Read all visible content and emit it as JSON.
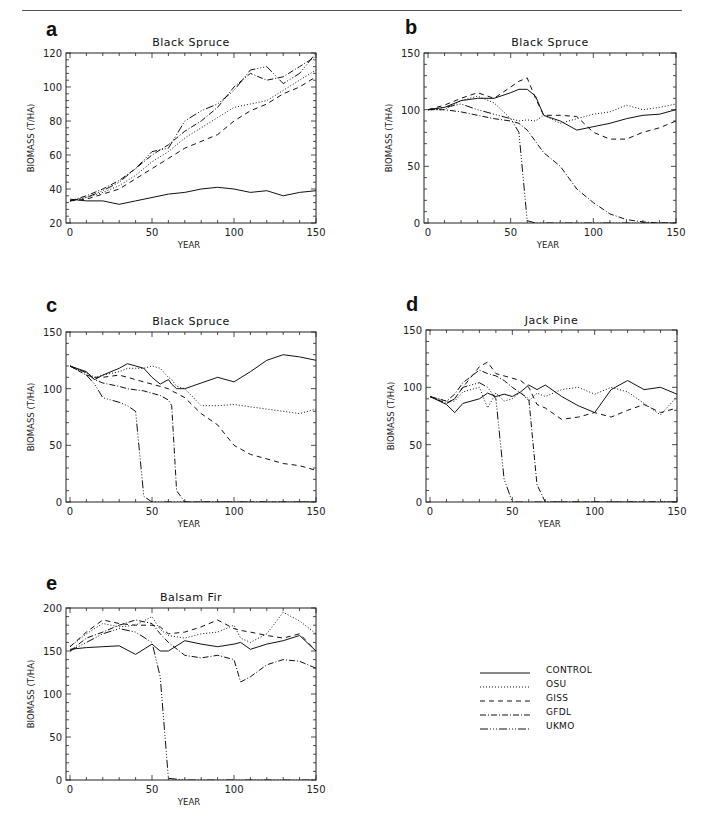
{
  "page": {
    "number": ""
  },
  "legend": {
    "items": [
      {
        "label": "CONTROL",
        "dash": ""
      },
      {
        "label": "OSU",
        "dash": "1,2"
      },
      {
        "label": "GISS",
        "dash": "5,4"
      },
      {
        "label": "GFDL",
        "dash": "6,2,1,2"
      },
      {
        "label": "UKMO",
        "dash": "8,2,1,2,1,2,1,2"
      }
    ]
  },
  "chart_data": [
    {
      "panel": "a",
      "type": "line",
      "title": "Black Spruce",
      "xlabel": "YEAR",
      "ylabel": "BIOMASS (T/HA)",
      "xlim": [
        0,
        150
      ],
      "ylim": [
        20,
        120
      ],
      "xticks": [
        0,
        50,
        100,
        150
      ],
      "yticks": [
        20,
        40,
        60,
        80,
        100,
        120
      ],
      "box": {
        "left": 70,
        "top": 53,
        "width": 246,
        "height": 170
      },
      "x": [
        0,
        10,
        20,
        30,
        40,
        50,
        60,
        70,
        80,
        90,
        100,
        110,
        120,
        130,
        140,
        150
      ],
      "series": [
        {
          "name": "CONTROL",
          "values": [
            34,
            33,
            33,
            31,
            33,
            35,
            37,
            38,
            40,
            41,
            40,
            38,
            39,
            36,
            38,
            39
          ]
        },
        {
          "name": "OSU",
          "values": [
            33,
            35,
            38,
            42,
            48,
            56,
            62,
            70,
            76,
            82,
            88,
            90,
            92,
            98,
            104,
            110
          ]
        },
        {
          "name": "GISS",
          "values": [
            33,
            34,
            37,
            40,
            46,
            52,
            58,
            64,
            68,
            72,
            80,
            86,
            90,
            96,
            100,
            106
          ]
        },
        {
          "name": "GFDL",
          "values": [
            33,
            36,
            40,
            45,
            52,
            60,
            66,
            74,
            80,
            88,
            100,
            108,
            104,
            106,
            112,
            118
          ]
        },
        {
          "name": "UKMO",
          "values": [
            33,
            35,
            39,
            44,
            52,
            62,
            64,
            80,
            86,
            90,
            98,
            110,
            112,
            102,
            108,
            120
          ]
        }
      ]
    },
    {
      "panel": "b",
      "type": "line",
      "title": "Black Spruce",
      "xlabel": "YEAR",
      "ylabel": "BIOMASS (T/HA)",
      "xlim": [
        0,
        150
      ],
      "ylim": [
        0,
        150
      ],
      "xticks": [
        0,
        50,
        100,
        150
      ],
      "yticks": [
        0,
        50,
        100,
        150
      ],
      "box": {
        "left": 428,
        "top": 53,
        "width": 248,
        "height": 170
      },
      "x": [
        0,
        10,
        20,
        30,
        40,
        50,
        55,
        60,
        65,
        70,
        80,
        90,
        100,
        110,
        120,
        130,
        140,
        150
      ],
      "series": [
        {
          "name": "CONTROL",
          "values": [
            100,
            102,
            108,
            110,
            110,
            115,
            118,
            118,
            112,
            95,
            90,
            82,
            85,
            88,
            92,
            95,
            96,
            100
          ]
        },
        {
          "name": "OSU",
          "values": [
            100,
            100,
            108,
            112,
            106,
            92,
            90,
            91,
            90,
            95,
            88,
            92,
            96,
            98,
            104,
            100,
            102,
            105
          ]
        },
        {
          "name": "GISS",
          "values": [
            100,
            104,
            110,
            115,
            110,
            120,
            125,
            128,
            110,
            95,
            95,
            94,
            80,
            74,
            74,
            80,
            84,
            90
          ]
        },
        {
          "name": "GFDL",
          "values": [
            100,
            100,
            98,
            95,
            92,
            90,
            88,
            82,
            72,
            62,
            50,
            30,
            18,
            8,
            3,
            1,
            0,
            0
          ]
        },
        {
          "name": "UKMO",
          "values": [
            100,
            102,
            105,
            100,
            96,
            92,
            80,
            2,
            0,
            0,
            0,
            0,
            0,
            0,
            0,
            0,
            0,
            0
          ]
        }
      ]
    },
    {
      "panel": "c",
      "type": "line",
      "title": "Black Spruce",
      "xlabel": "YEAR",
      "ylabel": "BIOMASS (T/HA)",
      "xlim": [
        0,
        150
      ],
      "ylim": [
        0,
        150
      ],
      "xticks": [
        0,
        50,
        100,
        150
      ],
      "yticks": [
        0,
        50,
        100,
        150
      ],
      "box": {
        "left": 70,
        "top": 332,
        "width": 246,
        "height": 170
      },
      "x": [
        0,
        10,
        15,
        20,
        30,
        35,
        40,
        45,
        50,
        55,
        60,
        62,
        65,
        70,
        80,
        90,
        100,
        110,
        120,
        130,
        140,
        150
      ],
      "series": [
        {
          "name": "CONTROL",
          "values": [
            120,
            115,
            108,
            112,
            118,
            122,
            120,
            118,
            110,
            104,
            108,
            104,
            100,
            100,
            105,
            110,
            106,
            115,
            125,
            130,
            128,
            125
          ]
        },
        {
          "name": "OSU",
          "values": [
            120,
            114,
            110,
            112,
            115,
            118,
            118,
            118,
            120,
            118,
            110,
            108,
            102,
            100,
            85,
            85,
            86,
            84,
            82,
            80,
            78,
            82
          ]
        },
        {
          "name": "GISS",
          "values": [
            120,
            112,
            110,
            110,
            112,
            110,
            108,
            106,
            104,
            102,
            100,
            98,
            96,
            92,
            78,
            68,
            50,
            42,
            38,
            34,
            32,
            28
          ]
        },
        {
          "name": "GFDL",
          "values": [
            120,
            114,
            108,
            105,
            102,
            100,
            99,
            98,
            96,
            94,
            90,
            85,
            10,
            0,
            0,
            0,
            0,
            0,
            0,
            0,
            0,
            0
          ]
        },
        {
          "name": "UKMO",
          "values": [
            120,
            112,
            104,
            92,
            88,
            85,
            80,
            5,
            0,
            0,
            0,
            0,
            0,
            0,
            0,
            0,
            0,
            0,
            0,
            0,
            0,
            0
          ]
        }
      ]
    },
    {
      "panel": "d",
      "type": "line",
      "title": "Jack Pine",
      "xlabel": "YEAR",
      "ylabel": "BIOMASS (T/HA)",
      "xlim": [
        0,
        150
      ],
      "ylim": [
        0,
        150
      ],
      "xticks": [
        0,
        50,
        100,
        150
      ],
      "yticks": [
        0,
        50,
        100,
        150
      ],
      "box": {
        "left": 430,
        "top": 330,
        "width": 247,
        "height": 172
      },
      "x": [
        0,
        10,
        15,
        20,
        30,
        35,
        40,
        45,
        50,
        55,
        60,
        65,
        70,
        80,
        90,
        100,
        110,
        120,
        130,
        140,
        150
      ],
      "series": [
        {
          "name": "CONTROL",
          "values": [
            92,
            85,
            78,
            86,
            90,
            95,
            92,
            94,
            92,
            96,
            102,
            98,
            102,
            92,
            84,
            78,
            98,
            106,
            98,
            100,
            94
          ]
        },
        {
          "name": "OSU",
          "values": [
            92,
            88,
            88,
            96,
            100,
            82,
            95,
            88,
            90,
            96,
            88,
            95,
            92,
            98,
            100,
            94,
            100,
            96,
            86,
            76,
            92
          ]
        },
        {
          "name": "GISS",
          "values": [
            92,
            86,
            90,
            100,
            118,
            122,
            112,
            110,
            108,
            106,
            100,
            85,
            82,
            72,
            74,
            78,
            74,
            80,
            85,
            78,
            82
          ]
        },
        {
          "name": "GFDL",
          "values": [
            92,
            88,
            94,
            104,
            115,
            112,
            110,
            106,
            100,
            95,
            90,
            15,
            0,
            0,
            0,
            0,
            0,
            0,
            0,
            0,
            0
          ]
        },
        {
          "name": "UKMO",
          "values": [
            92,
            86,
            90,
            100,
            104,
            100,
            90,
            20,
            0,
            0,
            0,
            0,
            0,
            0,
            0,
            0,
            0,
            0,
            0,
            0,
            0
          ]
        }
      ]
    },
    {
      "panel": "e",
      "type": "line",
      "title": "Balsam Fir",
      "xlabel": "YEAR",
      "ylabel": "BIOMASS (T/HA)",
      "xlim": [
        0,
        150
      ],
      "ylim": [
        0,
        200
      ],
      "xticks": [
        0,
        50,
        100,
        150
      ],
      "yticks": [
        0,
        50,
        100,
        150,
        200
      ],
      "box": {
        "left": 70,
        "top": 608,
        "width": 246,
        "height": 172
      },
      "x": [
        0,
        10,
        20,
        30,
        40,
        50,
        55,
        60,
        70,
        80,
        90,
        100,
        104,
        110,
        120,
        130,
        140,
        150
      ],
      "series": [
        {
          "name": "CONTROL",
          "values": [
            152,
            154,
            155,
            156,
            146,
            158,
            150,
            150,
            162,
            158,
            155,
            158,
            160,
            152,
            158,
            162,
            168,
            150
          ]
        },
        {
          "name": "OSU",
          "values": [
            155,
            170,
            182,
            178,
            180,
            190,
            175,
            168,
            165,
            170,
            172,
            180,
            165,
            160,
            170,
            195,
            185,
            170
          ]
        },
        {
          "name": "GISS",
          "values": [
            155,
            172,
            186,
            182,
            180,
            180,
            178,
            170,
            172,
            178,
            186,
            176,
            174,
            172,
            168,
            165,
            170,
            150
          ]
        },
        {
          "name": "GFDL",
          "values": [
            150,
            165,
            172,
            180,
            186,
            182,
            170,
            160,
            145,
            142,
            145,
            140,
            114,
            120,
            134,
            140,
            138,
            130
          ]
        },
        {
          "name": "UKMO",
          "values": [
            150,
            160,
            170,
            176,
            172,
            160,
            120,
            2,
            0,
            0,
            0,
            0,
            0,
            0,
            0,
            0,
            0,
            0
          ]
        }
      ]
    }
  ]
}
